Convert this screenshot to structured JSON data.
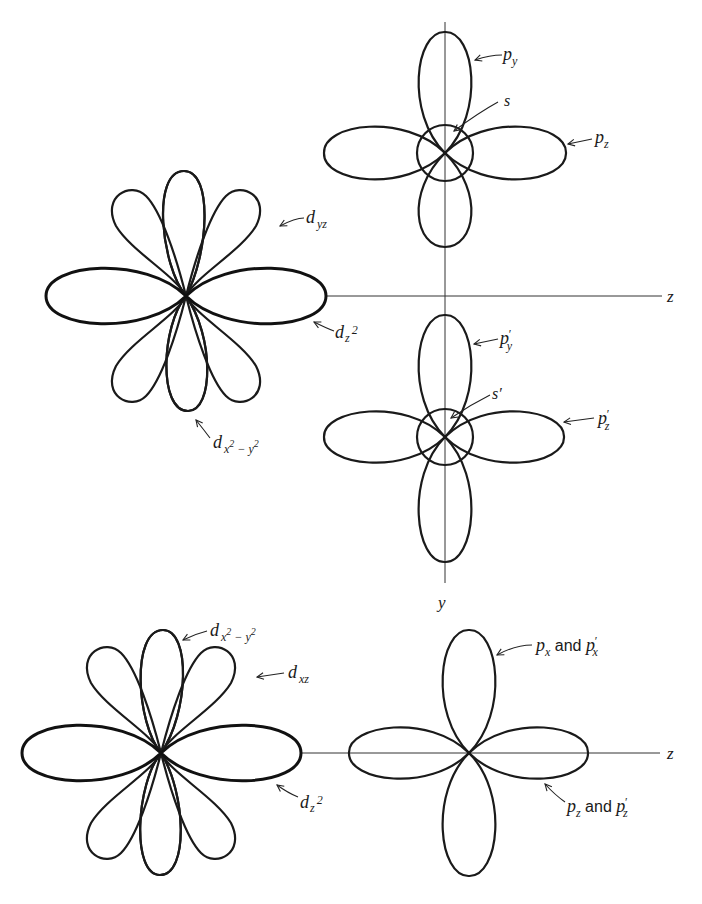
{
  "figure": {
    "axes": {
      "z_label": "z",
      "y_label": "y"
    },
    "top_p_orbitals": {
      "labels": {
        "py": "p",
        "py_sub": "y",
        "s": "s",
        "pz": "p",
        "pz_sub": "z"
      }
    },
    "primed_p_orbitals": {
      "labels": {
        "py": "p",
        "py_sub": "y",
        "py_prime": "′",
        "s": "s′",
        "pz": "p",
        "pz_sub": "z",
        "pz_prime": "′"
      }
    },
    "top_d_orbitals": {
      "labels": {
        "dyz": "d",
        "dyz_sub": "yz",
        "dz2": "d",
        "dz2_sub": "z",
        "dz2_sup": "2",
        "dx2y2": "d",
        "dx2y2_sub": "x",
        "dx2y2_sup1": "2",
        "dx2y2_minus": " − y",
        "dx2y2_sup2": "2"
      }
    },
    "bottom_d_orbitals": {
      "labels": {
        "dx2y2": "d",
        "dx2y2_sub": "x",
        "dx2y2_sup1": "2",
        "dx2y2_minus": " − y",
        "dx2y2_sup2": "2",
        "dxz": "d",
        "dxz_sub": "xz",
        "dz2": "d",
        "dz2_sub": "z",
        "dz2_sup": "2"
      }
    },
    "bottom_p_orbitals": {
      "labels": {
        "px": "p",
        "px_sub": "x",
        "px_and": " and ",
        "px2": "p",
        "px2_sub": "x",
        "px2_prime": "′",
        "pz": "p",
        "pz_sub": "z",
        "pz_and": " and ",
        "pz2": "p",
        "pz2_sub": "z",
        "pz2_prime": "′"
      }
    },
    "fill_styles": {
      "dz2_fill": "dotted gray",
      "dx2y2_fill": "diagonal hatching"
    }
  }
}
